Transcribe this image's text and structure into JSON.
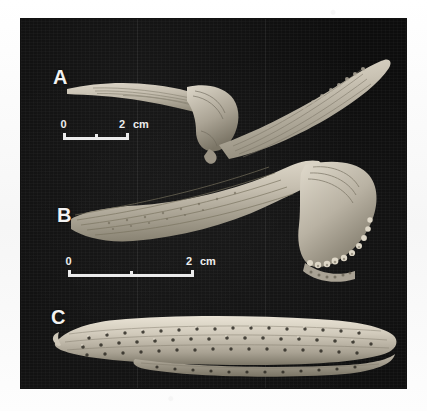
{
  "figure": {
    "kind": "photographic-plate",
    "background_color": "#fbfbfb",
    "plate_color": "#0b0b0b",
    "bone_color": "#c9c2b4",
    "panels": [
      {
        "letter": "A",
        "name": "specimen-a",
        "description": "V-shaped ridged bone element, left arm tapering, right arm elongate with longitudinal striations"
      },
      {
        "letter": "B",
        "name": "specimen-b",
        "description": "Elongate ridged bone with broad flared distal end bearing marginal tubercles"
      },
      {
        "letter": "C",
        "name": "specimen-c",
        "description": "Elongate plate covered with rows of tubercles and pits"
      }
    ],
    "scale_bars": [
      {
        "name": "scale-bar-a",
        "zero_label": "0",
        "max_label": "2",
        "unit_label": "cm",
        "ticks": 3
      },
      {
        "name": "scale-bar-b",
        "zero_label": "0",
        "max_label": "2",
        "unit_label": "cm",
        "ticks": 3
      }
    ]
  }
}
